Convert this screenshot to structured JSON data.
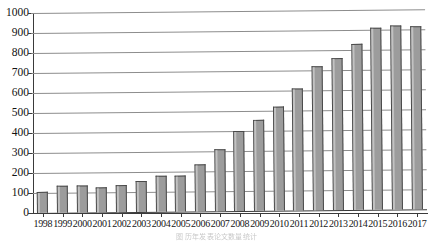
{
  "chart_data": {
    "type": "bar",
    "title": "",
    "xlabel": "",
    "ylabel": "",
    "ylim": [
      0,
      1000
    ],
    "ytick_step": 100,
    "grid": true,
    "legend": null,
    "bar_color": "#9c9c9c",
    "bar_edge_color": "#4a4a4a",
    "categories": [
      "1998",
      "1999",
      "2000",
      "2001",
      "2002",
      "2003",
      "2004",
      "2005",
      "2006",
      "2007",
      "2008",
      "2009",
      "2010",
      "2011",
      "2012",
      "2013",
      "2014",
      "2015",
      "2016",
      "2017"
    ],
    "values": [
      105,
      133,
      135,
      127,
      136,
      155,
      178,
      182,
      235,
      312,
      400,
      453,
      518,
      610,
      722,
      760,
      830,
      910,
      918,
      915
    ],
    "ytick_labels": [
      "0",
      "100",
      "200",
      "300",
      "400",
      "500",
      "600",
      "700",
      "800",
      "900",
      "1000"
    ],
    "ytick_values": [
      0,
      100,
      200,
      300,
      400,
      500,
      600,
      700,
      800,
      900,
      1000
    ]
  },
  "caption": {
    "text": "图  历年发表论文数量统计"
  }
}
